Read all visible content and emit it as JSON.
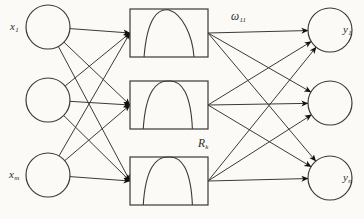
{
  "figure": {
    "type": "neural-network-diagram",
    "background_color": "#fbfaf7",
    "stroke_color": "#3a3a3a",
    "arrow_color": "#111111"
  },
  "input_layer": {
    "name": "input-layer",
    "node_radius": 22,
    "center_x": 48,
    "nodes": [
      {
        "id": "x1",
        "label": "x",
        "subscript": "1",
        "cy": 27,
        "label_x": 10,
        "label_y": 21
      },
      {
        "id": "x2",
        "label": "",
        "subscript": "",
        "cy": 100,
        "label_x": 0,
        "label_y": 0
      },
      {
        "id": "xm",
        "label": "x",
        "subscript": "m",
        "cy": 175,
        "label_x": 9,
        "label_y": 169
      }
    ]
  },
  "hidden_layer": {
    "name": "hidden-layer",
    "box_x": 130,
    "box_width": 78,
    "box_height": 48,
    "label": "R",
    "label_subscript": "k",
    "label_x": 198,
    "label_y": 138,
    "units": [
      {
        "id": "r1",
        "cy": 33,
        "curve": "bell-skew-right"
      },
      {
        "id": "r2",
        "cy": 105,
        "curve": "bell-symmetric"
      },
      {
        "id": "r3",
        "cy": 181,
        "curve": "bell-symmetric"
      }
    ]
  },
  "output_layer": {
    "name": "output-layer",
    "node_radius": 22,
    "center_x": 330,
    "nodes": [
      {
        "id": "y1",
        "label": "y",
        "subscript": "1",
        "cy": 30,
        "label_x": 343,
        "label_y": 24
      },
      {
        "id": "y2",
        "label": "",
        "subscript": "",
        "cy": 103,
        "label_x": 0,
        "label_y": 0
      },
      {
        "id": "yn",
        "label": "y",
        "subscript": "n",
        "cy": 178,
        "label_x": 343,
        "label_y": 172
      }
    ]
  },
  "weight_label": {
    "name": "weight-omega-11",
    "symbol": "ω",
    "subscript": "11",
    "x": 231,
    "y": 11
  },
  "bleed_through": [
    {
      "text": "",
      "x": 0,
      "y": 0
    }
  ]
}
